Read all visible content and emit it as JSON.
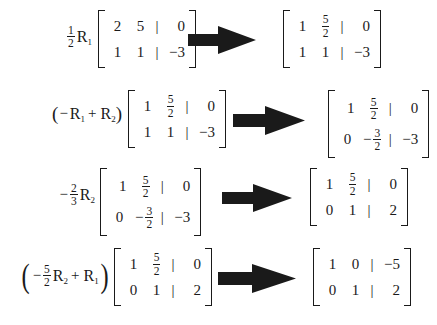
{
  "figure": {
    "title": "Gauss-Jordan row reduction steps",
    "background_color": "#ffffff",
    "ink_color": "#1a1a1a",
    "arrow_color": "#1a1a1a",
    "arrow_icon_name": "right-block-arrow-icon"
  },
  "steps": [
    {
      "id": "step-1",
      "operation": {
        "text": "1/2 R1",
        "parenthesized": false,
        "parts": [
          {
            "kind": "fraction",
            "numerator": "1",
            "denominator": "2"
          },
          {
            "kind": "rowsym",
            "label": "R",
            "subscript": "1"
          }
        ]
      },
      "source_matrix": {
        "rows": [
          [
            "2",
            "5",
            "|",
            "0"
          ],
          [
            "1",
            "1",
            "|",
            "−3"
          ]
        ]
      },
      "result_matrix": {
        "rows": [
          [
            "1",
            "5/2",
            "|",
            "0"
          ],
          [
            "1",
            "1",
            "|",
            "−3"
          ]
        ]
      }
    },
    {
      "id": "step-2",
      "operation": {
        "text": "(−R1 + R2)",
        "parenthesized": true,
        "parts": [
          {
            "kind": "sign",
            "text": "−"
          },
          {
            "kind": "rowsym",
            "label": "R",
            "subscript": "1"
          },
          {
            "kind": "plus",
            "text": "+"
          },
          {
            "kind": "rowsym",
            "label": "R",
            "subscript": "2"
          }
        ]
      },
      "source_matrix": {
        "rows": [
          [
            "1",
            "5/2",
            "|",
            "0"
          ],
          [
            "1",
            "1",
            "|",
            "−3"
          ]
        ]
      },
      "result_matrix": {
        "rows": [
          [
            "1",
            "5/2",
            "|",
            "0"
          ],
          [
            "0",
            "−3/2",
            "|",
            "−3"
          ]
        ]
      }
    },
    {
      "id": "step-3",
      "operation": {
        "text": "−2/3 R2",
        "parenthesized": false,
        "parts": [
          {
            "kind": "sign",
            "text": "−"
          },
          {
            "kind": "fraction",
            "numerator": "2",
            "denominator": "3"
          },
          {
            "kind": "rowsym",
            "label": "R",
            "subscript": "2"
          }
        ]
      },
      "source_matrix": {
        "rows": [
          [
            "1",
            "5/2",
            "|",
            "0"
          ],
          [
            "0",
            "−3/2",
            "|",
            "−3"
          ]
        ]
      },
      "result_matrix": {
        "rows": [
          [
            "1",
            "5/2",
            "|",
            "0"
          ],
          [
            "0",
            "1",
            "|",
            "2"
          ]
        ]
      }
    },
    {
      "id": "step-4",
      "operation": {
        "text": "(−5/2 R2 + R1)",
        "parenthesized": true,
        "parts": [
          {
            "kind": "sign",
            "text": "−"
          },
          {
            "kind": "fraction",
            "numerator": "5",
            "denominator": "2"
          },
          {
            "kind": "rowsym",
            "label": "R",
            "subscript": "2"
          },
          {
            "kind": "plus",
            "text": "+"
          },
          {
            "kind": "rowsym",
            "label": "R",
            "subscript": "1"
          }
        ]
      },
      "source_matrix": {
        "rows": [
          [
            "1",
            "5/2",
            "|",
            "0"
          ],
          [
            "0",
            "1",
            "|",
            "2"
          ]
        ]
      },
      "result_matrix": {
        "rows": [
          [
            "1",
            "0",
            "|",
            "−5"
          ],
          [
            "0",
            "1",
            "|",
            "2"
          ]
        ]
      }
    }
  ],
  "symbols": {
    "open_paren": "(",
    "close_paren": ")",
    "plus": "+",
    "minus": "−",
    "aug_bar": "|",
    "R": "R"
  },
  "cells": {
    "one": "1",
    "two": "2",
    "three": "3",
    "five": "5",
    "zero": "0",
    "neg_three": "−3",
    "neg_five": "−5"
  },
  "subscripts": {
    "one": "1",
    "two": "2"
  }
}
